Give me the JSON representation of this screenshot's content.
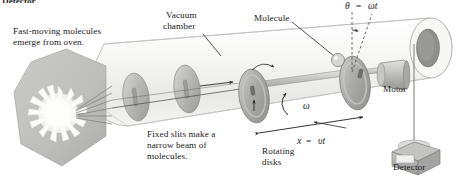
{
  "figure": {
    "cut_off_top_label": "Detector",
    "background_color": "#ffffff",
    "ink_color": "#1a1a1a",
    "tube_fill": "#f2f2f1",
    "tube_edge": "#9a9a99",
    "oven_fill": "#bfbfbd",
    "disk_fill": "#b9b9b7",
    "rotor_fill": "#a8a8a6",
    "detector_fill": "#b0b0ae"
  },
  "labels": {
    "oven_note_line1": "Fast-moving molecules",
    "oven_note_line2": "emerge from oven.",
    "vacuum_line1": "Vacuum",
    "vacuum_line2": "chamber",
    "molecule": "Molecule",
    "motor": "Motor",
    "detector": "Detector",
    "slits_line1": "Fixed slits make a",
    "slits_line2": "narrow beam of",
    "slits_line3": "molecules.",
    "rotating_line1": "Rotating",
    "rotating_line2": "disks"
  },
  "equations": {
    "theta": "θ",
    "theta_equals": "=",
    "theta_rhs": "ωt",
    "omega": "ω",
    "x_symbol": "x",
    "x_equals": "=",
    "x_rhs": "υt"
  },
  "physics": {
    "angle_relation": "θ = ωt",
    "distance_relation": "x = υt",
    "angular_velocity_symbol": "ω",
    "components": [
      "oven",
      "fixed-slit-disk-1",
      "fixed-slit-disk-2",
      "rotating-disk-1",
      "rotating-disk-2",
      "axle",
      "motor",
      "detector",
      "vacuum-chamber-tube"
    ]
  }
}
